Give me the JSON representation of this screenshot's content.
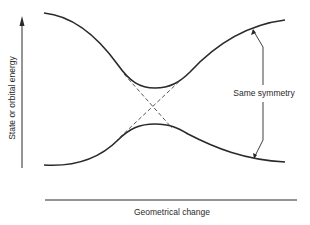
{
  "diagram": {
    "type": "avoided-crossing correlation diagram",
    "y_axis_label": "State or orbital energy",
    "x_axis_label": "Geometrical change",
    "annotation": "Same symmetry",
    "curves": [
      {
        "name": "upper-state",
        "style": "solid",
        "shape": "high at both ends, minimum at center"
      },
      {
        "name": "lower-state",
        "style": "solid",
        "shape": "low at both ends, maximum at center"
      },
      {
        "name": "diabatic-1",
        "style": "dashed",
        "shape": "descending diagonal through center"
      },
      {
        "name": "diabatic-2",
        "style": "dashed",
        "shape": "ascending diagonal through center"
      }
    ],
    "colors": {
      "line": "#2a2a2a",
      "background": "#ffffff"
    }
  }
}
